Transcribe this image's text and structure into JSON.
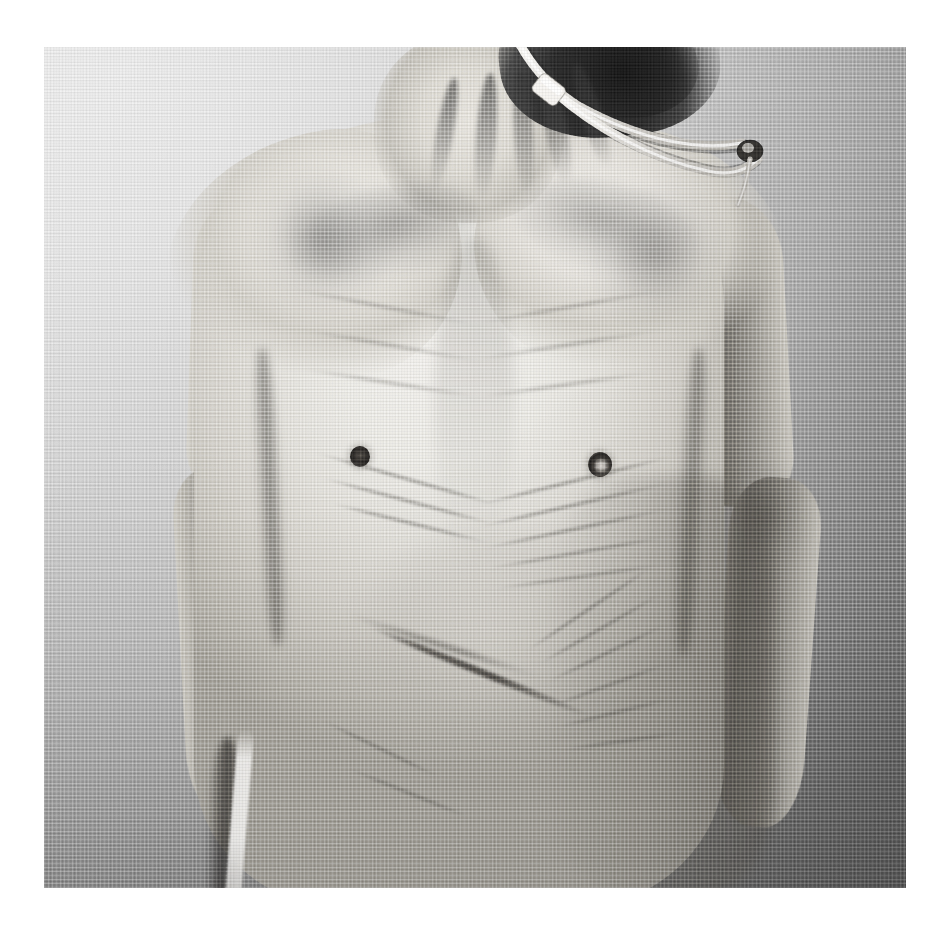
{
  "page": {
    "width": 948,
    "height": 950,
    "background_color": "#ffffff",
    "kind": "photographic-print"
  },
  "print": {
    "x": 44,
    "y": 47,
    "width": 862,
    "height": 841,
    "medium": "black-and-white photograph on woven canvas-textured paper",
    "surface_texture": "fine linen weave, approx 3 px pitch",
    "border": "white paper margin on all four sides"
  },
  "tone": {
    "backdrop_light": "#e3e3e3",
    "backdrop_mid": "#b4b4b4",
    "backdrop_dark": "#6e6e6e",
    "skin_highlight": "#f2f0ec",
    "skin_mid": "#d2cfc8",
    "skin_shadow": "#6e6b65",
    "deep_shadow": "#1a1a1a",
    "tube_white": "#f4f2ee",
    "paper_white": "#ffffff"
  },
  "subject": {
    "description": "Frontal view of a severely emaciated human torso, cropped from the lower jaw to the hips",
    "orientation": "frontal, centered, arms hanging at the sides",
    "lighting": "soft directional key light from upper left; backdrop falls off to dark in the lower right",
    "regions": [
      {
        "name": "head-and-hair",
        "label": "Dark hair and underside of chin, cropped by the top edge"
      },
      {
        "name": "neck",
        "label": "Thin neck with prominent sternocleidomastoid tendons and deep hollows"
      },
      {
        "name": "clavicles",
        "label": "Sharply protruding collarbones with deep supraclavicular fossae"
      },
      {
        "name": "shoulders",
        "label": "Bony shoulders with wasted deltoid muscles"
      },
      {
        "name": "chest",
        "label": "Flat wasted chest, visible ribs and sternum, two nipples"
      },
      {
        "name": "abdomen",
        "label": "Sunken abdomen with loose, deeply folded skin"
      },
      {
        "name": "left-arm",
        "label": "Wasted left arm with prominent elbow joint"
      },
      {
        "name": "right-arm",
        "label": "Wasted right arm with prominent elbow joint"
      },
      {
        "name": "hips",
        "label": "Iliac crests and hip bones with a bright highlight down the left flank"
      }
    ]
  },
  "medical_device": {
    "name": "tubing",
    "label": "Clear medical tubing draped over the subject's left shoulder",
    "parts": [
      {
        "name": "tube-upper-run",
        "label": "Tube descending from the neck across the shoulder"
      },
      {
        "name": "tube-clip",
        "label": "White slide clip / connector on the tube near the neck"
      },
      {
        "name": "tube-lower-run",
        "label": "Second tube limb running parallel across the shoulder"
      },
      {
        "name": "tube-end-fitting",
        "label": "Dark connector fitting at the shoulder edge where the tube turns down"
      }
    ]
  },
  "accessibility": {
    "alt_text": "Black-and-white photograph printed on canvas-textured paper showing the emaciated torso of a person, arms at their sides, with medical tubing draped over one shoulder."
  }
}
